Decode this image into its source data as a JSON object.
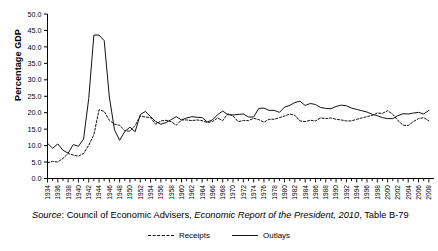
{
  "axis": {
    "ylabel": "Percentage GDP",
    "yticks": [
      "0.0",
      "5.0",
      "10.0",
      "15.0",
      "20.0",
      "25.0",
      "30.0",
      "35.0",
      "40.0",
      "45.0",
      "50.0"
    ],
    "xticks": [
      "1934",
      "1936",
      "1938",
      "1940",
      "1942",
      "1944",
      "1946",
      "1948",
      "1950",
      "1952",
      "1954",
      "1956",
      "1958",
      "1960",
      "1962",
      "1964",
      "1966",
      "1968",
      "1970",
      "1972",
      "1974",
      "1976",
      "1978",
      "1980",
      "1982",
      "1984",
      "1986",
      "1988",
      "1990",
      "1992",
      "1994",
      "1996",
      "1998",
      "2000",
      "2002",
      "2004",
      "2006",
      "2008"
    ]
  },
  "legend": {
    "receipts_label": "Receipts",
    "outlays_label": "Outlays"
  },
  "source": {
    "prefix": "Source",
    "colon": ": ",
    "org": "Council of Economic Advisers, ",
    "title": "Economic Report of the President, 2010",
    "suffix": ", Table B-79"
  },
  "colors": {
    "line": "#111111",
    "axis": "#000000",
    "background": "#ffffff"
  },
  "chart_data": {
    "type": "line",
    "title": "",
    "xlabel": "",
    "ylabel": "Percentage GDP",
    "xlim": [
      1934,
      2009
    ],
    "ylim": [
      0.0,
      50.0
    ],
    "ytick_step": 5.0,
    "xtick_step_labeled": 2,
    "xtick_step_minor": 1,
    "grid": false,
    "legend_position": "bottom-center",
    "x": [
      1934,
      1935,
      1936,
      1937,
      1938,
      1939,
      1940,
      1941,
      1942,
      1943,
      1944,
      1945,
      1946,
      1947,
      1948,
      1949,
      1950,
      1951,
      1952,
      1953,
      1954,
      1955,
      1956,
      1957,
      1958,
      1959,
      1960,
      1961,
      1962,
      1963,
      1964,
      1965,
      1966,
      1967,
      1968,
      1969,
      1970,
      1971,
      1972,
      1973,
      1974,
      1975,
      1976,
      1977,
      1978,
      1979,
      1980,
      1981,
      1982,
      1983,
      1984,
      1985,
      1986,
      1987,
      1988,
      1989,
      1990,
      1991,
      1992,
      1993,
      1994,
      1995,
      1996,
      1997,
      1998,
      1999,
      2000,
      2001,
      2002,
      2003,
      2004,
      2005,
      2006,
      2007,
      2008
    ],
    "series": [
      {
        "name": "Receipts",
        "style": "dashed",
        "values": [
          4.8,
          5.2,
          5.0,
          6.1,
          7.6,
          7.1,
          6.8,
          7.6,
          10.1,
          13.3,
          20.9,
          20.4,
          17.7,
          16.5,
          16.2,
          14.5,
          14.4,
          16.1,
          19.0,
          18.7,
          18.5,
          16.5,
          17.5,
          17.7,
          17.3,
          16.2,
          17.8,
          17.8,
          17.6,
          17.8,
          17.6,
          17.0,
          17.3,
          18.4,
          17.6,
          19.7,
          19.0,
          17.3,
          17.6,
          17.6,
          18.3,
          17.9,
          17.1,
          18.0,
          18.0,
          18.5,
          19.0,
          19.6,
          19.2,
          17.5,
          17.3,
          17.7,
          17.5,
          18.4,
          18.2,
          18.4,
          18.0,
          17.8,
          17.5,
          17.5,
          18.0,
          18.4,
          18.8,
          19.2,
          19.9,
          19.8,
          20.6,
          19.5,
          17.6,
          16.2,
          16.1,
          17.3,
          18.2,
          18.5,
          17.5
        ]
      },
      {
        "name": "Outlays",
        "style": "solid",
        "values": [
          10.7,
          9.2,
          10.5,
          8.6,
          7.7,
          10.3,
          9.8,
          12.0,
          24.3,
          43.6,
          43.6,
          41.9,
          24.8,
          14.8,
          11.6,
          14.3,
          15.6,
          14.2,
          19.4,
          20.4,
          18.8,
          17.3,
          16.5,
          17.0,
          17.9,
          18.8,
          17.8,
          18.4,
          18.8,
          18.6,
          18.5,
          17.2,
          17.8,
          19.4,
          20.5,
          19.4,
          19.3,
          19.5,
          19.6,
          18.7,
          18.7,
          21.3,
          21.4,
          20.7,
          20.7,
          20.1,
          21.7,
          22.2,
          23.1,
          23.5,
          22.2,
          22.8,
          22.5,
          21.6,
          21.3,
          21.2,
          21.9,
          22.3,
          22.1,
          21.4,
          21.0,
          20.6,
          20.2,
          19.5,
          19.1,
          18.5,
          18.2,
          18.2,
          19.1,
          19.7,
          19.6,
          19.9,
          20.1,
          19.6,
          20.7
        ]
      }
    ]
  }
}
